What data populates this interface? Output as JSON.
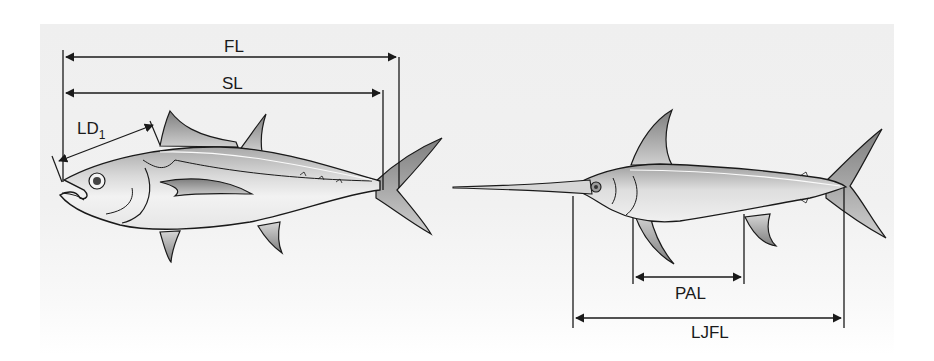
{
  "figure": {
    "tuna": {
      "labels": {
        "fork_length": "FL",
        "standard_length": "SL",
        "predorsal_length_main": "LD",
        "predorsal_length_sub": "1"
      }
    },
    "swordfish": {
      "labels": {
        "pectoral_anal_length": "PAL",
        "lower_jaw_fork_length": "LJFL"
      }
    },
    "colors": {
      "line": "#1a1a1a",
      "body_light": "#f4f4f4",
      "body_dark": "#9a9a9a",
      "fin": "#8c8c8c",
      "panel": "#efefef"
    }
  }
}
